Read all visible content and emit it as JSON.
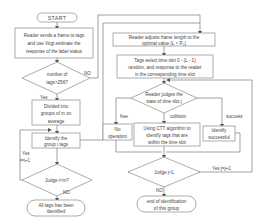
{
  "flowchart": {
    "start": "START",
    "left": {
      "send_frame": [
        "Reader sends a frame to tags",
        "and use Vogt estimate  the",
        "response of the label status"
      ],
      "decision_tags": [
        "number of",
        "tags>256?"
      ],
      "decision_tags_no": "NO",
      "decision_tags_yes": "Yes",
      "divide": [
        "Divided into",
        "groups of m on",
        "average"
      ],
      "identify_group": [
        "Identify the",
        "group i  tags"
      ],
      "loop_label": [
        "Yes",
        "i=i+1"
      ],
      "decision_i": "Judge i<m?",
      "decision_i_no": "NO",
      "end_all": [
        "All tags has been",
        "identified"
      ]
    },
    "right": {
      "adjust_frame": [
        "Reader adjusts frame length to the",
        "optimal value (L < P₀)"
      ],
      "select_slot": [
        "Tags select  time slot 0 - (L - 1)",
        "random, and  response to the reader",
        "in the corresponding time slot"
      ],
      "decision_state": [
        "Reader judges the",
        "state of time slot j"
      ],
      "branch_free": "free",
      "branch_collision": "collision",
      "branch_success": "success",
      "no_operation": [
        "No",
        "operation"
      ],
      "ctt": [
        "Using CTT algorithm to",
        "identify tags that are",
        "within the time slot"
      ],
      "identify_success": [
        "Identify",
        "successful"
      ],
      "decision_j": "Judge j<L",
      "decision_j_yes": "Yes j=j+1",
      "decision_j_no": "NO",
      "end_group": [
        "end of  identification",
        "of this group"
      ]
    }
  }
}
